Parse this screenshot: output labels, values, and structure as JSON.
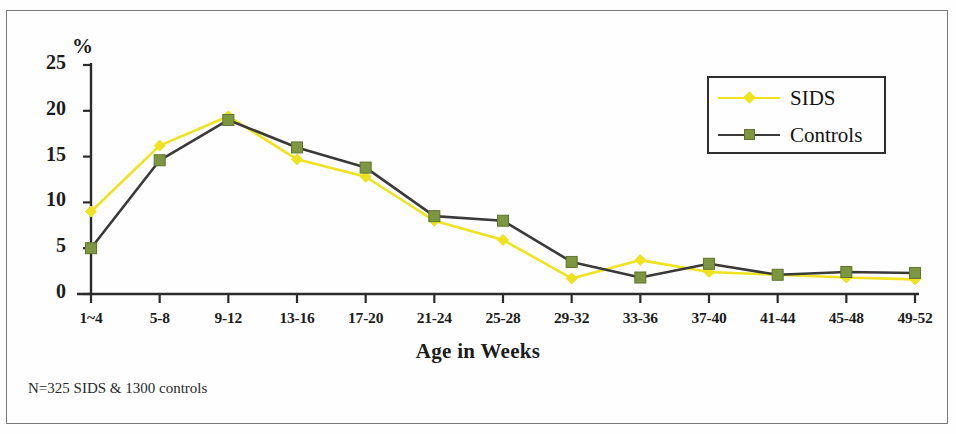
{
  "chart_data": {
    "type": "line",
    "title": "",
    "xlabel": "Age in Weeks",
    "ylabel": "%",
    "categories": [
      "1~4",
      "5-8",
      "9-12",
      "13-16",
      "17-20",
      "21-24",
      "25-28",
      "29-32",
      "33-36",
      "37-40",
      "41-44",
      "45-48",
      "49-52"
    ],
    "series": [
      {
        "name": "SIDS",
        "color": "#efe21f",
        "marker": "diamond",
        "values": [
          9.0,
          16.2,
          19.4,
          14.7,
          12.8,
          8.0,
          5.9,
          1.7,
          3.7,
          2.4,
          2.1,
          1.8,
          1.6
        ]
      },
      {
        "name": "Controls",
        "color": "#7d9640",
        "line_color": "#3a3a3a",
        "marker": "square",
        "values": [
          5.0,
          14.6,
          19.0,
          16.0,
          13.8,
          8.5,
          8.0,
          3.5,
          1.8,
          3.3,
          2.1,
          2.4,
          2.3
        ]
      }
    ],
    "ylim": [
      0,
      25
    ],
    "yticks": [
      0,
      5,
      10,
      15,
      20,
      25
    ],
    "ytick_labels": [
      "0",
      "5",
      "10",
      "15",
      "20",
      "25"
    ],
    "grid": false,
    "legend_position": "top-right"
  },
  "legend": {
    "entries": [
      {
        "label": "SIDS"
      },
      {
        "label": "Controls"
      }
    ]
  },
  "footnote": {
    "text": "N=325 SIDS & 1300 controls"
  },
  "axes": {
    "y_unit_label": "%",
    "x_title": "Age in Weeks"
  }
}
